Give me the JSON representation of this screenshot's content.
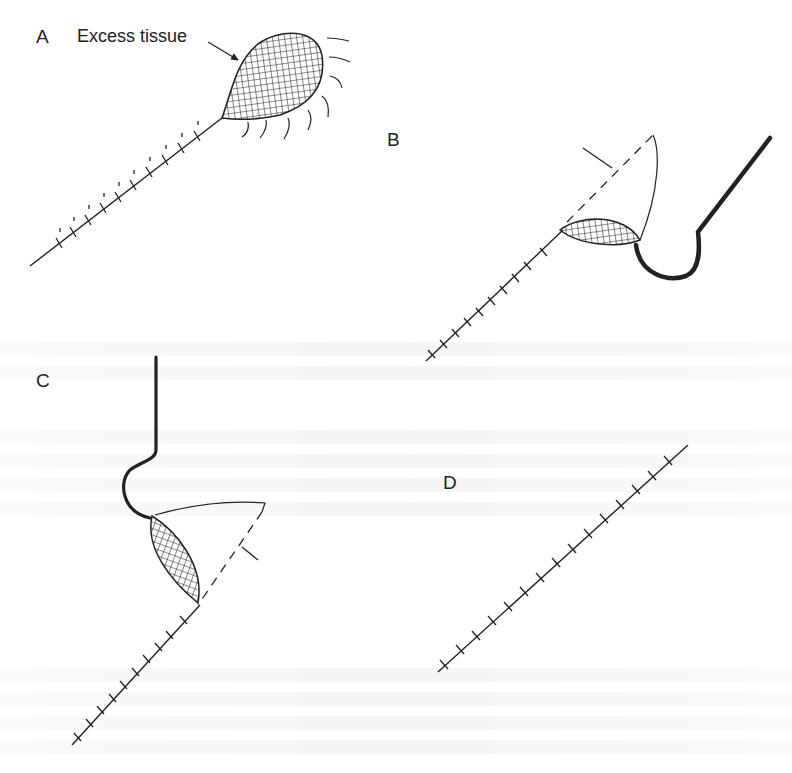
{
  "figure": {
    "panels": [
      {
        "id": "A",
        "label": "A",
        "callout": "Excess tissue"
      },
      {
        "id": "B",
        "label": "B"
      },
      {
        "id": "C",
        "label": "C"
      },
      {
        "id": "D",
        "label": "D"
      }
    ],
    "colors": {
      "ink": "#222222",
      "background": "#ffffff"
    }
  }
}
